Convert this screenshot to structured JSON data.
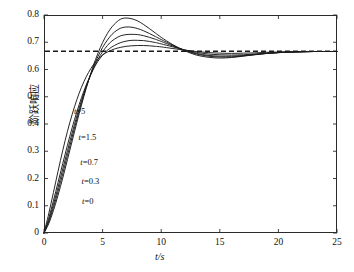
{
  "chart_data": {
    "type": "line",
    "title": "",
    "xlabel": "t/s",
    "ylabel": "阶跃响应",
    "xlim": [
      0,
      25
    ],
    "ylim": [
      0,
      0.8
    ],
    "xticks": [
      "0",
      "5",
      "10",
      "15",
      "20",
      "25"
    ],
    "xtick_values": [
      0,
      5,
      10,
      15,
      20,
      25
    ],
    "yticks": [
      "0",
      "0.1",
      "0.2",
      "0.3",
      "0.4",
      "0.5",
      "0.6",
      "0.7",
      "0.8"
    ],
    "ytick_values": [
      0,
      0.1,
      0.2,
      0.3,
      0.4,
      0.5,
      0.6,
      0.7,
      0.8
    ],
    "grid": false,
    "legend_position": "inline-annotations",
    "line_color": "#1a1a1a",
    "reference_line": {
      "value": 0.667,
      "style": "dashed",
      "color": "#1a1a1a",
      "label": ""
    },
    "annotations": [
      {
        "text": "t=5",
        "x": 2.55,
        "y": 0.447
      },
      {
        "text": "t=1.5",
        "x": 2.95,
        "y": 0.352
      },
      {
        "text": "t=0.7",
        "x": 3.1,
        "y": 0.262
      },
      {
        "text": "t=0.3",
        "x": 3.2,
        "y": 0.192
      },
      {
        "text": "t=0",
        "x": 3.25,
        "y": 0.118
      }
    ],
    "series": [
      {
        "name": "t=5",
        "peak_time": 8.3,
        "peak_value": 0.688,
        "x": [
          0,
          0.4,
          0.8,
          1.2,
          1.6,
          2.0,
          2.4,
          2.8,
          3.2,
          3.6,
          4.0,
          4.4,
          4.8,
          5.2,
          5.6,
          6.0,
          6.5,
          7.0,
          7.5,
          8.0,
          8.5,
          9.0,
          9.5,
          10.0,
          11.0,
          12.0,
          13.0,
          14.0,
          15.0,
          16.0,
          17.0,
          18.0,
          19.0,
          20.0,
          21.0,
          22.0,
          23.0,
          24.0,
          25.0
        ],
        "y": [
          0,
          0.07,
          0.148,
          0.227,
          0.303,
          0.373,
          0.435,
          0.489,
          0.535,
          0.573,
          0.604,
          0.628,
          0.646,
          0.659,
          0.668,
          0.675,
          0.681,
          0.685,
          0.687,
          0.688,
          0.688,
          0.687,
          0.685,
          0.683,
          0.677,
          0.671,
          0.666,
          0.662,
          0.66,
          0.659,
          0.66,
          0.661,
          0.663,
          0.664,
          0.665,
          0.666,
          0.666,
          0.666,
          0.666
        ]
      },
      {
        "name": "t=1.5",
        "peak_time": 8.2,
        "peak_value": 0.707,
        "x": [
          0,
          0.4,
          0.8,
          1.2,
          1.6,
          2.0,
          2.4,
          2.8,
          3.2,
          3.6,
          4.0,
          4.4,
          4.8,
          5.2,
          5.6,
          6.0,
          6.5,
          7.0,
          7.5,
          8.0,
          8.5,
          9.0,
          9.5,
          10.0,
          11.0,
          12.0,
          13.0,
          14.0,
          15.0,
          16.0,
          17.0,
          18.0,
          19.0,
          20.0,
          21.0,
          22.0,
          23.0,
          24.0,
          25.0
        ],
        "y": [
          0,
          0.054,
          0.118,
          0.186,
          0.255,
          0.322,
          0.386,
          0.444,
          0.497,
          0.543,
          0.583,
          0.616,
          0.642,
          0.662,
          0.677,
          0.688,
          0.698,
          0.704,
          0.707,
          0.707,
          0.706,
          0.703,
          0.699,
          0.694,
          0.683,
          0.672,
          0.663,
          0.657,
          0.654,
          0.653,
          0.654,
          0.657,
          0.66,
          0.662,
          0.664,
          0.665,
          0.666,
          0.666,
          0.666
        ]
      },
      {
        "name": "t=0.7",
        "peak_time": 8.2,
        "peak_value": 0.728,
        "x": [
          0,
          0.4,
          0.8,
          1.2,
          1.6,
          2.0,
          2.4,
          2.8,
          3.2,
          3.6,
          4.0,
          4.4,
          4.8,
          5.2,
          5.6,
          6.0,
          6.5,
          7.0,
          7.5,
          8.0,
          8.5,
          9.0,
          9.5,
          10.0,
          11.0,
          12.0,
          13.0,
          14.0,
          15.0,
          16.0,
          17.0,
          18.0,
          19.0,
          20.0,
          21.0,
          22.0,
          23.0,
          24.0,
          25.0
        ],
        "y": [
          0,
          0.046,
          0.104,
          0.168,
          0.235,
          0.302,
          0.367,
          0.429,
          0.486,
          0.537,
          0.582,
          0.62,
          0.652,
          0.677,
          0.697,
          0.711,
          0.723,
          0.728,
          0.729,
          0.728,
          0.724,
          0.718,
          0.711,
          0.703,
          0.686,
          0.671,
          0.659,
          0.652,
          0.649,
          0.649,
          0.651,
          0.655,
          0.659,
          0.662,
          0.664,
          0.665,
          0.666,
          0.666,
          0.666
        ]
      },
      {
        "name": "t=0.3",
        "peak_time": 8.1,
        "peak_value": 0.755,
        "x": [
          0,
          0.4,
          0.8,
          1.2,
          1.6,
          2.0,
          2.4,
          2.8,
          3.2,
          3.6,
          4.0,
          4.4,
          4.8,
          5.2,
          5.6,
          6.0,
          6.5,
          7.0,
          7.5,
          8.0,
          8.5,
          9.0,
          9.5,
          10.0,
          11.0,
          12.0,
          13.0,
          14.0,
          15.0,
          16.0,
          17.0,
          18.0,
          19.0,
          20.0,
          21.0,
          22.0,
          23.0,
          24.0,
          25.0
        ],
        "y": [
          0,
          0.04,
          0.093,
          0.153,
          0.218,
          0.285,
          0.352,
          0.417,
          0.478,
          0.534,
          0.584,
          0.628,
          0.665,
          0.695,
          0.719,
          0.737,
          0.751,
          0.756,
          0.755,
          0.75,
          0.742,
          0.732,
          0.721,
          0.71,
          0.689,
          0.67,
          0.657,
          0.649,
          0.646,
          0.646,
          0.65,
          0.655,
          0.659,
          0.662,
          0.664,
          0.665,
          0.666,
          0.666,
          0.666
        ]
      },
      {
        "name": "t=0",
        "peak_time": 8.1,
        "peak_value": 0.787,
        "x": [
          0,
          0.4,
          0.8,
          1.2,
          1.6,
          2.0,
          2.4,
          2.8,
          3.2,
          3.6,
          4.0,
          4.4,
          4.8,
          5.2,
          5.6,
          6.0,
          6.5,
          7.0,
          7.5,
          8.0,
          8.5,
          9.0,
          9.5,
          10.0,
          11.0,
          12.0,
          13.0,
          14.0,
          15.0,
          16.0,
          17.0,
          18.0,
          19.0,
          20.0,
          21.0,
          22.0,
          23.0,
          24.0,
          25.0
        ],
        "y": [
          0,
          0.034,
          0.082,
          0.139,
          0.202,
          0.269,
          0.337,
          0.405,
          0.47,
          0.531,
          0.587,
          0.637,
          0.68,
          0.716,
          0.745,
          0.766,
          0.784,
          0.789,
          0.786,
          0.778,
          0.765,
          0.75,
          0.734,
          0.718,
          0.691,
          0.669,
          0.653,
          0.645,
          0.642,
          0.644,
          0.649,
          0.654,
          0.659,
          0.662,
          0.664,
          0.665,
          0.666,
          0.666,
          0.666
        ]
      }
    ]
  }
}
